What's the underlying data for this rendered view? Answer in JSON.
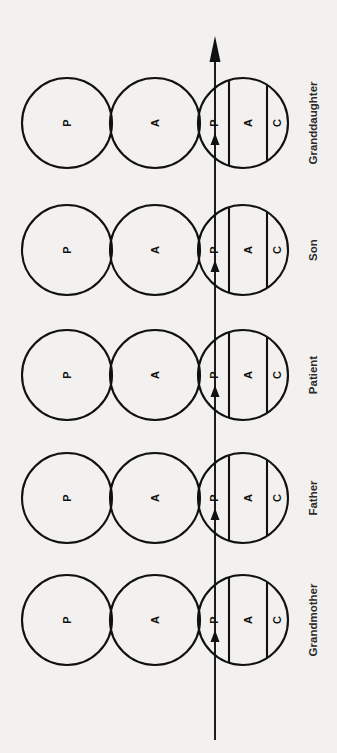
{
  "figure": {
    "type": "diagram",
    "orientation": "rotated-90-ccw",
    "background_color": "#f2f1ef",
    "stroke_color": "#111111",
    "label_color": "#2b2b2b"
  },
  "groups": [
    {
      "label": "Grandmother",
      "circles": [
        {
          "name": "circle-p",
          "letter": "P",
          "divided": false
        },
        {
          "name": "circle-a",
          "letter": "A",
          "divided": false
        },
        {
          "name": "circle-pac",
          "divided": true,
          "segments": [
            "P",
            "A",
            "C"
          ]
        }
      ],
      "arrow_marker": true
    },
    {
      "label": "Father",
      "circles": [
        {
          "name": "circle-p",
          "letter": "P",
          "divided": false
        },
        {
          "name": "circle-a",
          "letter": "A",
          "divided": false
        },
        {
          "name": "circle-pac",
          "divided": true,
          "segments": [
            "P",
            "A",
            "C"
          ]
        }
      ],
      "arrow_marker": true
    },
    {
      "label": "Patient",
      "circles": [
        {
          "name": "circle-p",
          "letter": "P",
          "divided": false
        },
        {
          "name": "circle-a",
          "letter": "A",
          "divided": false
        },
        {
          "name": "circle-pac",
          "divided": true,
          "segments": [
            "P",
            "A",
            "C"
          ]
        }
      ],
      "arrow_marker": true
    },
    {
      "label": "Son",
      "circles": [
        {
          "name": "circle-p",
          "letter": "P",
          "divided": false
        },
        {
          "name": "circle-a",
          "letter": "A",
          "divided": false
        },
        {
          "name": "circle-pac",
          "divided": true,
          "segments": [
            "P",
            "A",
            "C"
          ]
        }
      ],
      "arrow_marker": true
    },
    {
      "label": "Granddaughter",
      "circles": [
        {
          "name": "circle-p",
          "letter": "P",
          "divided": false
        },
        {
          "name": "circle-a",
          "letter": "A",
          "divided": false
        },
        {
          "name": "circle-pac",
          "divided": true,
          "segments": [
            "P",
            "A",
            "C"
          ]
        }
      ],
      "arrow_marker": true
    }
  ],
  "main_axis": {
    "name": "time-axis-arrow",
    "has_terminal_arrowhead": true,
    "direction": "upward"
  }
}
